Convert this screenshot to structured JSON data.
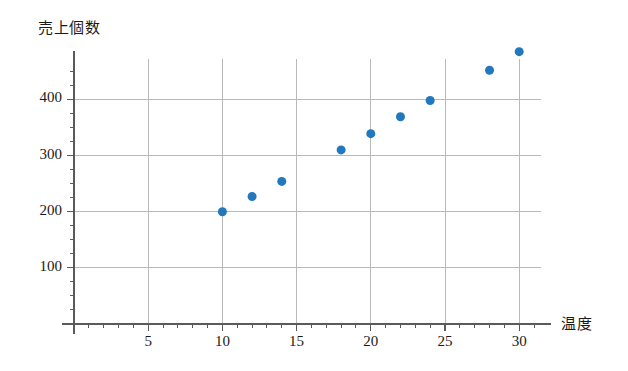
{
  "chart_data": {
    "type": "scatter",
    "title": "",
    "xlabel": "温度",
    "ylabel": "売上個数",
    "xlim": [
      0,
      31.5
    ],
    "ylim": [
      0,
      472
    ],
    "grid": true,
    "legend": false,
    "marker_color": "#2278bd",
    "marker_size": 9,
    "x": [
      10,
      12,
      14,
      18,
      20,
      22,
      24,
      28,
      30
    ],
    "y": [
      200,
      227,
      254,
      310,
      339,
      369,
      398,
      452,
      485
    ],
    "points": [
      {
        "x": 10,
        "y": 200
      },
      {
        "x": 12,
        "y": 227
      },
      {
        "x": 14,
        "y": 254
      },
      {
        "x": 18,
        "y": 310
      },
      {
        "x": 20,
        "y": 339
      },
      {
        "x": 22,
        "y": 369
      },
      {
        "x": 24,
        "y": 398
      },
      {
        "x": 28,
        "y": 452
      },
      {
        "x": 30,
        "y": 485
      }
    ],
    "x_ticks": [
      5,
      10,
      15,
      20,
      25,
      30
    ],
    "x_tick_labels": [
      "5",
      "10",
      "15",
      "20",
      "25",
      "30"
    ],
    "x_minor_step": 1,
    "y_ticks": [
      100,
      200,
      300,
      400
    ],
    "y_tick_labels": [
      "100",
      "200",
      "300",
      "400"
    ],
    "y_minor_step": 25
  },
  "axes": {
    "y_title": "売上個数",
    "x_title": "温度"
  },
  "colors": {
    "marker": "#2278bd",
    "grid": "#b9b9b9",
    "axis": "#5a5a5a",
    "text": "#1a1a1a",
    "background": "#ffffff"
  }
}
